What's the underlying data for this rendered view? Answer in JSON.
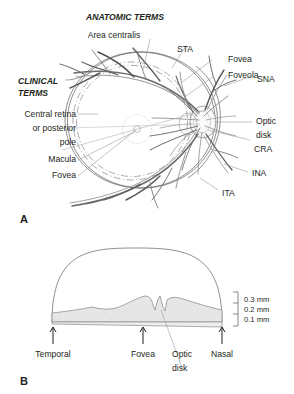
{
  "figure": {
    "title_anatomic": "ANATOMIC TERMS",
    "title_clinical_line1": "CLINICAL",
    "title_clinical_line2": "TERMS"
  },
  "panel_a": {
    "label": "A",
    "anatomic_labels": [
      {
        "id": "area-centralis",
        "text": "Area centralis"
      },
      {
        "id": "sta",
        "text": "STA"
      },
      {
        "id": "fovea-anatomic",
        "text": "Fovea"
      },
      {
        "id": "foveola",
        "text": "Foveola"
      },
      {
        "id": "sna",
        "text": "SNA"
      },
      {
        "id": "optic-disk-line1",
        "text": "Optic"
      },
      {
        "id": "optic-disk-line2",
        "text": "disk"
      },
      {
        "id": "cra",
        "text": "CRA"
      },
      {
        "id": "ina",
        "text": "INA"
      },
      {
        "id": "ita",
        "text": "ITA"
      }
    ],
    "clinical_labels": [
      {
        "id": "central-retina-line1",
        "text": "Central retina"
      },
      {
        "id": "central-retina-line2",
        "text": "or posterior"
      },
      {
        "id": "central-retina-line3",
        "text": "pole"
      },
      {
        "id": "macula",
        "text": "Macula"
      },
      {
        "id": "fovea-clinical",
        "text": "Fovea"
      }
    ]
  },
  "panel_b": {
    "label": "B",
    "landmarks": [
      {
        "id": "temporal",
        "text": "Temporal"
      },
      {
        "id": "fovea",
        "text": "Fovea"
      },
      {
        "id": "optic-disk-line1",
        "text": "Optic"
      },
      {
        "id": "optic-disk-line2",
        "text": "disk"
      },
      {
        "id": "nasal",
        "text": "Nasal"
      }
    ],
    "scale_ticks": [
      {
        "id": "t03",
        "text": "0.3 mm"
      },
      {
        "id": "t02",
        "text": "0.2 mm"
      },
      {
        "id": "t01",
        "text": "0.1 mm"
      }
    ]
  },
  "colors": {
    "ink": "#231f20",
    "vessel_dark": "#4a4a4a",
    "vessel_light": "#9b9b9b",
    "leader": "#9a9a9a",
    "retina_fill": "#e3e3e3",
    "outline": "#606060",
    "background": "#ffffff"
  }
}
